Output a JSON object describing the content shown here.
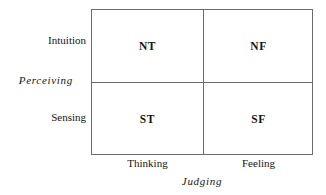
{
  "chart_data": {
    "type": "table",
    "title": "",
    "xlabel": "Judging",
    "ylabel": "Perceiving",
    "categories": [
      "Thinking",
      "Feeling"
    ],
    "rows": [
      "Intuition",
      "Sensing"
    ],
    "cells": [
      [
        "NT",
        "NF"
      ],
      [
        "ST",
        "SF"
      ]
    ],
    "grid": true,
    "legend": "none",
    "annotations": []
  },
  "matrix": {
    "y_axis": {
      "label": "Perceiving",
      "rows": [
        {
          "label": "Intuition"
        },
        {
          "label": "Sensing"
        }
      ]
    },
    "x_axis": {
      "label": "Judging",
      "columns": [
        {
          "label": "Thinking"
        },
        {
          "label": "Feeling"
        }
      ]
    },
    "quadrants": {
      "top_left": "NT",
      "top_right": "NF",
      "bottom_left": "ST",
      "bottom_right": "SF"
    }
  },
  "colors": {
    "line": "#6b6b6b",
    "text": "#141414",
    "background": "#ffffff"
  }
}
